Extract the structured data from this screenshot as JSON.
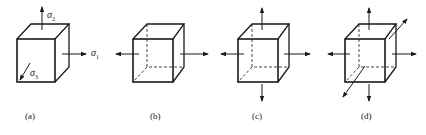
{
  "figure": {
    "panels": [
      {
        "id": "a",
        "caption": "(a)",
        "arrows": [
          "up",
          "right",
          "front-down-left"
        ],
        "stress_labels": {
          "sigma2": "σ",
          "sigma2_sub": "2",
          "sigma1": "σ",
          "sigma1_sub": "1",
          "sigma3": "σ",
          "sigma3_sub": "3"
        }
      },
      {
        "id": "b",
        "caption": "(b)",
        "arrows": [
          "left",
          "right"
        ]
      },
      {
        "id": "c",
        "caption": "(c)",
        "arrows": [
          "up",
          "down",
          "left",
          "right"
        ]
      },
      {
        "id": "d",
        "caption": "(d)",
        "arrows": [
          "up",
          "down",
          "left",
          "right",
          "front",
          "back"
        ]
      }
    ],
    "line_color": "#1a1a1a"
  }
}
